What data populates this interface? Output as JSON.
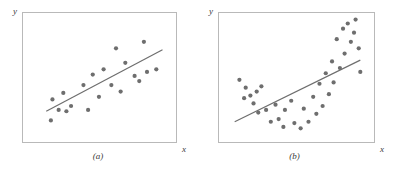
{
  "figure": {
    "background_color": "#ffffff",
    "mark_color": "#6e6e6e",
    "frame_color": "#b9b9b9",
    "text_color": "#3a3a3a"
  },
  "panels": [
    {
      "caption": "(a)",
      "y_axis_label": "y",
      "x_axis_label": "x",
      "frame": {
        "x": 22,
        "y": 12,
        "width": 155,
        "height": 131
      }
    },
    {
      "caption": "(b)",
      "y_axis_label": "y",
      "x_axis_label": "x",
      "frame": {
        "x": 22,
        "y": 12,
        "width": 157,
        "height": 131
      }
    }
  ],
  "chart_data": [
    {
      "type": "scatter",
      "title": "(a)",
      "xlabel": "x",
      "ylabel": "y",
      "xlim": [
        0,
        100
      ],
      "ylim": [
        0,
        100
      ],
      "grid": false,
      "legend": "none",
      "annotation": "Linear regression line fits the data well; residuals scattered randomly about the line.",
      "series": [
        {
          "name": "observations",
          "marker": "filled-circle",
          "color": "#6e6e6e",
          "points": [
            [
              18,
              18
            ],
            [
              19,
              34
            ],
            [
              23,
              26
            ],
            [
              26,
              39
            ],
            [
              28,
              25
            ],
            [
              31,
              29
            ],
            [
              39,
              45
            ],
            [
              42,
              26
            ],
            [
              45,
              53
            ],
            [
              49,
              36
            ],
            [
              52,
              57
            ],
            [
              57,
              45
            ],
            [
              60,
              73
            ],
            [
              63,
              40
            ],
            [
              66,
              62
            ],
            [
              72,
              52
            ],
            [
              75,
              48
            ],
            [
              78,
              78
            ],
            [
              80,
              55
            ],
            [
              86,
              57
            ]
          ]
        }
      ],
      "fit_line": {
        "name": "least-squares line",
        "color": "#6e6e6e",
        "from": [
          15,
          25
        ],
        "to": [
          90,
          72
        ]
      }
    },
    {
      "type": "scatter",
      "title": "(b)",
      "xlabel": "x",
      "ylabel": "y",
      "xlim": [
        0,
        100
      ],
      "ylim": [
        0,
        100
      ],
      "grid": false,
      "legend": "none",
      "annotation": "Data follow a curved (U-shaped) pattern; the straight line is an inadequate fit.",
      "series": [
        {
          "name": "observations",
          "marker": "filled-circle",
          "color": "#6e6e6e",
          "points": [
            [
              13,
              49
            ],
            [
              17,
              43
            ],
            [
              16,
              35
            ],
            [
              20,
              37
            ],
            [
              22,
              31
            ],
            [
              24,
              40
            ],
            [
              27,
              44
            ],
            [
              25,
              24
            ],
            [
              30,
              26
            ],
            [
              33,
              17
            ],
            [
              36,
              30
            ],
            [
              38,
              19
            ],
            [
              42,
              26
            ],
            [
              41,
              13
            ],
            [
              46,
              33
            ],
            [
              48,
              16
            ],
            [
              52,
              12
            ],
            [
              54,
              27
            ],
            [
              57,
              17
            ],
            [
              60,
              36
            ],
            [
              62,
              23
            ],
            [
              64,
              46
            ],
            [
              66,
              29
            ],
            [
              68,
              54
            ],
            [
              70,
              38
            ],
            [
              72,
              63
            ],
            [
              73,
              47
            ],
            [
              75,
              80
            ],
            [
              77,
              58
            ],
            [
              79,
              88
            ],
            [
              80,
              69
            ],
            [
              82,
              92
            ],
            [
              84,
              78
            ],
            [
              86,
              85
            ],
            [
              87,
              95
            ],
            [
              89,
              73
            ],
            [
              90,
              55
            ]
          ]
        }
      ],
      "fit_line": {
        "name": "least-squares line",
        "color": "#6e6e6e",
        "from": [
          10,
          17
        ],
        "to": [
          90,
          64
        ]
      }
    }
  ]
}
